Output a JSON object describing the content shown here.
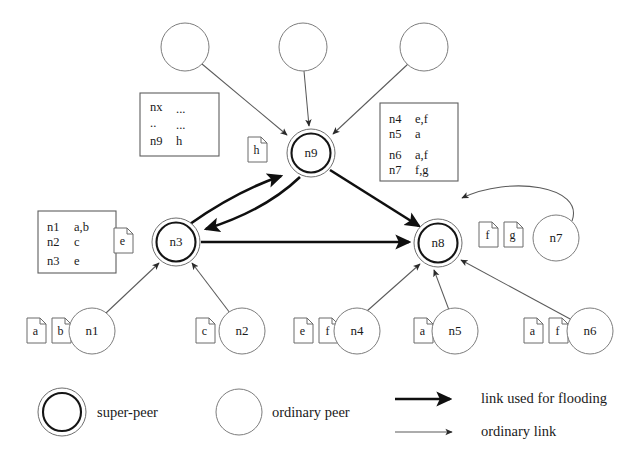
{
  "diagram": {
    "nodes": [
      {
        "id": "u1",
        "label": "",
        "type": "ordinary-peer",
        "cx": 185,
        "cy": 47,
        "r": 24
      },
      {
        "id": "u2",
        "label": "",
        "type": "ordinary-peer",
        "cx": 303,
        "cy": 47,
        "r": 24
      },
      {
        "id": "u3",
        "label": "",
        "type": "ordinary-peer",
        "cx": 424,
        "cy": 47,
        "r": 24
      },
      {
        "id": "n9",
        "label": "n9",
        "type": "super-peer",
        "cx": 311,
        "cy": 153,
        "r": 24
      },
      {
        "id": "n3",
        "label": "n3",
        "type": "super-peer",
        "cx": 176,
        "cy": 242,
        "r": 24
      },
      {
        "id": "n8",
        "label": "n8",
        "type": "super-peer",
        "cx": 438,
        "cy": 243,
        "r": 24
      },
      {
        "id": "n7",
        "label": "n7",
        "type": "ordinary-peer",
        "cx": 556,
        "cy": 238,
        "r": 23
      },
      {
        "id": "n1",
        "label": "n1",
        "type": "ordinary-peer",
        "cx": 92,
        "cy": 331,
        "r": 23
      },
      {
        "id": "n2",
        "label": "n2",
        "type": "ordinary-peer",
        "cx": 242,
        "cy": 331,
        "r": 23
      },
      {
        "id": "n4",
        "label": "n4",
        "type": "ordinary-peer",
        "cx": 357,
        "cy": 331,
        "r": 23
      },
      {
        "id": "n5",
        "label": "n5",
        "type": "ordinary-peer",
        "cx": 455,
        "cy": 331,
        "r": 23
      },
      {
        "id": "n6",
        "label": "n6",
        "type": "ordinary-peer",
        "cx": 590,
        "cy": 331,
        "r": 23
      }
    ],
    "documents": [
      {
        "label": "a",
        "x": 27,
        "y": 318
      },
      {
        "label": "b",
        "x": 52,
        "y": 318
      },
      {
        "label": "c",
        "x": 196,
        "y": 318
      },
      {
        "label": "e",
        "x": 294,
        "y": 318
      },
      {
        "label": "f",
        "x": 319,
        "y": 318
      },
      {
        "label": "a",
        "x": 414,
        "y": 318
      },
      {
        "label": "a",
        "x": 524,
        "y": 318
      },
      {
        "label": "f",
        "x": 549,
        "y": 318
      },
      {
        "label": "f",
        "x": 479,
        "y": 222
      },
      {
        "label": "g",
        "x": 504,
        "y": 222
      },
      {
        "label": "e",
        "x": 114,
        "y": 228
      },
      {
        "label": "h",
        "x": 248,
        "y": 137
      }
    ],
    "index_tables": [
      {
        "name": "n9-index",
        "x": 140,
        "y": 93,
        "width": 79,
        "height": 63,
        "rows": [
          {
            "key": "nx",
            "value": "..."
          },
          {
            "key": "..",
            "value": "..."
          },
          {
            "key": "n9",
            "value": "h"
          }
        ]
      },
      {
        "name": "n8-index",
        "x": 380,
        "y": 103,
        "width": 78,
        "height": 78,
        "rows": [
          {
            "key": "n4",
            "value": "e,f"
          },
          {
            "key": "n5",
            "value": "a"
          },
          {
            "key": "n6",
            "value": "a,f"
          },
          {
            "key": "n7",
            "value": "f,g"
          }
        ]
      },
      {
        "name": "n3-index",
        "x": 38,
        "y": 211,
        "width": 78,
        "height": 62,
        "rows": [
          {
            "key": "n1",
            "value": "a,b"
          },
          {
            "key": "n2",
            "value": "c"
          },
          {
            "key": "n3",
            "value": "e"
          }
        ]
      }
    ],
    "legend": {
      "items": [
        {
          "name": "super-peer",
          "label": "super-peer",
          "kind": "super-peer"
        },
        {
          "name": "ordinary-peer",
          "label": "ordinary peer",
          "kind": "ordinary-peer"
        },
        {
          "name": "link-used-for-flooding",
          "label": "link used for flooding",
          "kind": "flood-arrow"
        },
        {
          "name": "ordinary-link",
          "label": "ordinary link",
          "kind": "ordinary-arrow"
        }
      ]
    }
  }
}
